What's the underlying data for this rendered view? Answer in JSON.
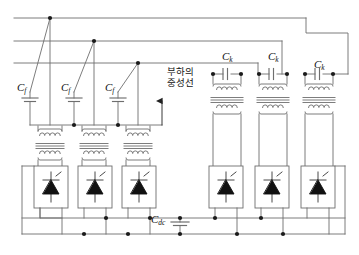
{
  "figure": {
    "type": "circuit-schematic",
    "width": 359,
    "height": 255,
    "background": "#ffffff",
    "line_color": "#6e6e6e",
    "node_color": "#1a1a1a",
    "text_color": "#111111"
  },
  "labels": {
    "filter_caps": [
      {
        "id": "cf1",
        "base": "C",
        "sub": "f",
        "x": 17,
        "y": 82
      },
      {
        "id": "cf2",
        "base": "C",
        "sub": "f",
        "x": 61,
        "y": 82
      },
      {
        "id": "cf3",
        "base": "C",
        "sub": "f",
        "x": 105,
        "y": 82
      }
    ],
    "coupling_caps": [
      {
        "id": "ck1",
        "base": "C",
        "sub": "k",
        "x": 222,
        "y": 51
      },
      {
        "id": "ck2",
        "base": "C",
        "sub": "k",
        "x": 268,
        "y": 51
      },
      {
        "id": "ck3",
        "base": "C",
        "sub": "k",
        "x": 314,
        "y": 59
      }
    ],
    "dc_cap": {
      "id": "cdc",
      "base": "C",
      "sub": "dc",
      "x": 160,
      "y": 213
    },
    "neutral_note": {
      "line1": "부하의",
      "line2": "중성선",
      "x": 152,
      "y": 66
    }
  },
  "components": {
    "ac_bus_lines": 3,
    "filter_capacitor_count": 3,
    "left_transformer_count": 3,
    "neutral_transformer_count": 1,
    "right_transformer_count": 3,
    "coupling_capacitor_count": 3,
    "converter_block_count": 6,
    "converter_symbol": "thyristor",
    "dc_rail_count": 2,
    "dc_link_capacitor_count": 1
  },
  "icons": {
    "neutral_arrow": "arrow-up-icon",
    "thyristor": "thyristor-icon",
    "capacitor": "capacitor-icon",
    "transformer": "transformer-icon"
  }
}
